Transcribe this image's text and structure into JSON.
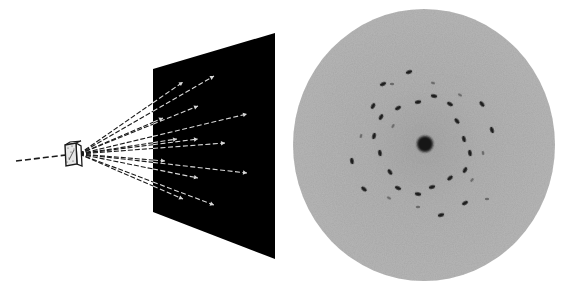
{
  "figure": {
    "title": "X-ray diffraction: schematic and diffraction pattern",
    "colors": {
      "background": "#ffffff",
      "line": "#1a1a1a",
      "screen": "#000000",
      "ray_on_screen": "#d8d8d8",
      "disc": "#b5b5b5",
      "disc_center_shade": "#a9a9a9",
      "spot": "#1e1e1e",
      "spot_faint": "#6a6a6a",
      "center_spot": "#151515"
    },
    "incident_beam": {
      "x1": 16,
      "y1": 161,
      "x2": 66,
      "y2": 155
    },
    "crystal": {
      "front": [
        [
          65,
          145
        ],
        [
          76,
          143
        ],
        [
          77,
          164
        ],
        [
          66,
          166
        ]
      ],
      "side": [
        [
          76,
          143
        ],
        [
          81,
          146
        ],
        [
          82,
          166
        ],
        [
          77,
          164
        ]
      ],
      "top": [
        [
          65,
          145
        ],
        [
          70,
          142
        ],
        [
          81,
          141
        ],
        [
          76,
          143
        ]
      ],
      "origin": [
        79,
        154
      ]
    },
    "screen": {
      "corners": [
        [
          153,
          69
        ],
        [
          275,
          33
        ],
        [
          275,
          259
        ],
        [
          153,
          212
        ]
      ]
    },
    "diffracted_rays": [
      {
        "end": [
          183,
          82
        ]
      },
      {
        "end": [
          214,
          76
        ]
      },
      {
        "end": [
          198,
          106
        ]
      },
      {
        "end": [
          247,
          114
        ]
      },
      {
        "end": [
          163,
          118
        ]
      },
      {
        "end": [
          177,
          139
        ]
      },
      {
        "end": [
          198,
          139
        ]
      },
      {
        "end": [
          225,
          143
        ]
      },
      {
        "end": [
          165,
          161
        ]
      },
      {
        "end": [
          247,
          173
        ]
      },
      {
        "end": [
          198,
          178
        ]
      },
      {
        "end": [
          183,
          199
        ]
      },
      {
        "end": [
          214,
          205
        ]
      }
    ],
    "pattern": {
      "cx": 424,
      "cy": 145,
      "rx": 131,
      "ry": 136,
      "center_spot": {
        "cx": 425,
        "cy": 144,
        "r": 8
      },
      "spots": [
        {
          "x": 409,
          "y": 72,
          "angle": -20,
          "strong": true
        },
        {
          "x": 383,
          "y": 84,
          "angle": -25,
          "strong": true
        },
        {
          "x": 392,
          "y": 84,
          "angle": 0,
          "strong": false
        },
        {
          "x": 433,
          "y": 83,
          "angle": 15,
          "strong": false
        },
        {
          "x": 434,
          "y": 96,
          "angle": 10,
          "strong": true
        },
        {
          "x": 418,
          "y": 102,
          "angle": -10,
          "strong": true
        },
        {
          "x": 398,
          "y": 108,
          "angle": -30,
          "strong": true
        },
        {
          "x": 373,
          "y": 106,
          "angle": -60,
          "strong": true
        },
        {
          "x": 381,
          "y": 117,
          "angle": -60,
          "strong": true
        },
        {
          "x": 393,
          "y": 126,
          "angle": -60,
          "strong": false
        },
        {
          "x": 374,
          "y": 136,
          "angle": -75,
          "strong": true
        },
        {
          "x": 361,
          "y": 136,
          "angle": -75,
          "strong": false
        },
        {
          "x": 450,
          "y": 104,
          "angle": 30,
          "strong": true
        },
        {
          "x": 460,
          "y": 95,
          "angle": 30,
          "strong": false
        },
        {
          "x": 482,
          "y": 104,
          "angle": 50,
          "strong": true
        },
        {
          "x": 457,
          "y": 121,
          "angle": 50,
          "strong": true
        },
        {
          "x": 492,
          "y": 130,
          "angle": 70,
          "strong": true
        },
        {
          "x": 464,
          "y": 139,
          "angle": 75,
          "strong": true
        },
        {
          "x": 470,
          "y": 153,
          "angle": 80,
          "strong": true
        },
        {
          "x": 483,
          "y": 153,
          "angle": 80,
          "strong": false
        },
        {
          "x": 465,
          "y": 170,
          "angle": -60,
          "strong": true
        },
        {
          "x": 450,
          "y": 178,
          "angle": -40,
          "strong": true
        },
        {
          "x": 472,
          "y": 180,
          "angle": -50,
          "strong": false
        },
        {
          "x": 487,
          "y": 199,
          "angle": 0,
          "strong": false
        },
        {
          "x": 465,
          "y": 203,
          "angle": -30,
          "strong": true
        },
        {
          "x": 441,
          "y": 215,
          "angle": -15,
          "strong": true
        },
        {
          "x": 432,
          "y": 187,
          "angle": -15,
          "strong": true
        },
        {
          "x": 418,
          "y": 194,
          "angle": 10,
          "strong": true
        },
        {
          "x": 418,
          "y": 207,
          "angle": 0,
          "strong": false
        },
        {
          "x": 398,
          "y": 188,
          "angle": 25,
          "strong": true
        },
        {
          "x": 389,
          "y": 198,
          "angle": 30,
          "strong": false
        },
        {
          "x": 390,
          "y": 172,
          "angle": 55,
          "strong": true
        },
        {
          "x": 364,
          "y": 189,
          "angle": 40,
          "strong": true
        },
        {
          "x": 380,
          "y": 153,
          "angle": 80,
          "strong": true
        },
        {
          "x": 352,
          "y": 161,
          "angle": 80,
          "strong": true
        }
      ]
    }
  }
}
